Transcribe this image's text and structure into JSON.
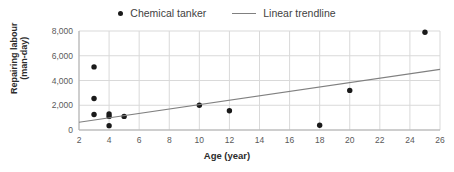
{
  "legend": {
    "position": "top-center",
    "entries": [
      {
        "label": "Chemical tanker",
        "marker": "dot-marker-icon",
        "color": "#1a1a1a"
      },
      {
        "label": "Linear trendline",
        "marker": "line-marker-icon",
        "color": "#808080"
      }
    ]
  },
  "axes": {
    "xlabel": "Age (year)",
    "ylabel_line1": "Repairing labour",
    "ylabel_line2": "(man-day)"
  },
  "chart_data": {
    "type": "scatter",
    "title": "",
    "xlabel": "Age (year)",
    "ylabel": "Repairing labour (man-day)",
    "xlim": [
      2,
      26
    ],
    "ylim": [
      0,
      8000
    ],
    "xticks": [
      2,
      4,
      6,
      8,
      10,
      12,
      14,
      16,
      18,
      20,
      22,
      24,
      26
    ],
    "xtick_labels": [
      "2",
      "4",
      "6",
      "8",
      "10",
      "12",
      "14",
      "16",
      "18",
      "20",
      "22",
      "24",
      "26"
    ],
    "yticks": [
      0,
      2000,
      4000,
      6000,
      8000
    ],
    "ytick_labels": [
      "0",
      "2,000",
      "4,000",
      "6,000",
      "8,000"
    ],
    "grid": true,
    "grid_color": "#d9d9d9",
    "legend_position": "top-center",
    "series": [
      {
        "name": "Chemical tanker",
        "type": "scatter",
        "color": "#1a1a1a",
        "marker": "circle",
        "x": [
          3,
          3,
          3,
          4,
          4,
          4,
          5,
          10,
          12,
          18,
          20,
          25
        ],
        "y": [
          5100,
          2550,
          1250,
          1300,
          1100,
          350,
          1100,
          2000,
          1550,
          380,
          3200,
          7900
        ]
      },
      {
        "name": "Linear trendline",
        "type": "line",
        "color": "#808080",
        "x": [
          2,
          26
        ],
        "y": [
          620,
          4900
        ]
      }
    ]
  }
}
